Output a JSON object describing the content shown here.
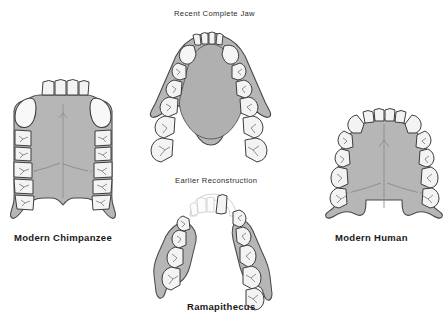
{
  "figure": {
    "background_color": "#ffffff",
    "bone_fill": "#b6b6b6",
    "bone_stroke": "#4a4a4a",
    "tooth_fill": "#f3f3f3",
    "tooth_stroke": "#3d3d3d",
    "ghost_stroke": "#cfcfcf",
    "label_color": "#1a1a1a"
  },
  "captions": {
    "modern_chimpanzee": "Modern Chimpanzee",
    "modern_human": "Modern Human",
    "ramapithecus": "Ramapithecus",
    "recent_complete_jaw": "Recent Complete Jaw",
    "earlier_reconstruction": "Earlier Reconstruction"
  },
  "specimens": [
    {
      "id": "modern-chimpanzee",
      "label": "Modern Chimpanzee",
      "arch_shape": "U-shaped with parallel tooth rows",
      "incisors": 4,
      "canines_per_side": 1,
      "cheek_teeth_per_side": 5,
      "position": "left"
    },
    {
      "id": "recent-complete-jaw",
      "label": "Recent Complete Jaw",
      "arch_shape": "parabolic V-shaped mandible",
      "incisors": 4,
      "canines_per_side": 1,
      "cheek_teeth_per_side": 6,
      "position": "top-center"
    },
    {
      "id": "earlier-reconstruction",
      "label": "Earlier Reconstruction",
      "arch_shape": "two separated fragments with ghosted anterior reconstruction",
      "incisors": 4,
      "canines_per_side": 1,
      "cheek_teeth_per_side": 5,
      "position": "bottom-center"
    },
    {
      "id": "modern-human",
      "label": "Modern Human",
      "arch_shape": "rounded parabolic arch",
      "incisors": 4,
      "canines_per_side": 1,
      "cheek_teeth_per_side": 6,
      "position": "right"
    }
  ]
}
